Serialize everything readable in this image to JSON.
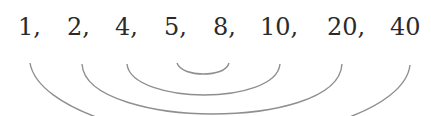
{
  "diagram": {
    "type": "factor-pairing",
    "numbers": [
      {
        "label": "1,",
        "x": 18
      },
      {
        "label": "2,",
        "x": 67
      },
      {
        "label": "4,",
        "x": 115
      },
      {
        "label": "5,",
        "x": 164
      },
      {
        "label": "8,",
        "x": 213
      },
      {
        "label": "10,",
        "x": 260
      },
      {
        "label": "20,",
        "x": 327
      },
      {
        "label": "40",
        "x": 390
      }
    ],
    "pairs": [
      {
        "from": "1",
        "to": "40"
      },
      {
        "from": "2",
        "to": "20"
      },
      {
        "from": "4",
        "to": "10"
      },
      {
        "from": "5",
        "to": "8"
      }
    ],
    "arc_color": "#8f8f8f",
    "text_color": "#2a2a2a"
  }
}
